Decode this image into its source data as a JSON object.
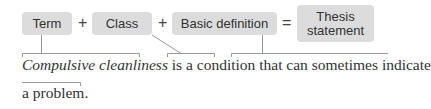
{
  "diagram": {
    "boxes": {
      "term": "Term",
      "class": "Class",
      "basic_definition": "Basic definition",
      "thesis_line1": "Thesis",
      "thesis_line2": "statement"
    },
    "operators": {
      "plus1": "+",
      "plus2": "+",
      "equals": "="
    },
    "sentence": {
      "term": "Compulsive cleanliness",
      "line1_rest": " is a condition that can sometimes indicate",
      "line2": "a problem."
    },
    "colors": {
      "box_fill": "#dcdcdc",
      "line": "#999999",
      "text": "#333333"
    }
  }
}
